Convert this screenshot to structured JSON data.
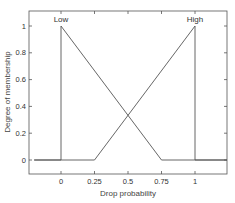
{
  "chart_data": {
    "type": "line",
    "title": "",
    "xlabel": "Drop probability",
    "ylabel": "Degree of membership",
    "xlim": [
      -0.2,
      1.25
    ],
    "ylim": [
      -0.1,
      1.1
    ],
    "grid": false,
    "legend": null,
    "xticks": [
      0,
      0.25,
      0.5,
      0.75,
      1
    ],
    "xtick_labels": [
      "0",
      "0.25",
      "0.5",
      "0.75",
      "1"
    ],
    "yticks": [
      0,
      0.2,
      0.4,
      0.6,
      0.8,
      1
    ],
    "ytick_labels": [
      "0",
      "0.2",
      "0.4",
      "0.6",
      "0.8",
      "1"
    ],
    "series": [
      {
        "name": "Low",
        "x": [
          -0.2,
          0,
          0,
          0.75,
          1.25
        ],
        "y": [
          0,
          0,
          1,
          0,
          0
        ]
      },
      {
        "name": "High",
        "x": [
          -0.2,
          0.25,
          1,
          1,
          1.25
        ],
        "y": [
          0,
          0,
          1,
          0,
          0
        ]
      }
    ],
    "annotations": [
      {
        "text": "Low",
        "x": 0,
        "y": 1
      },
      {
        "text": "High",
        "x": 1,
        "y": 1
      }
    ]
  }
}
